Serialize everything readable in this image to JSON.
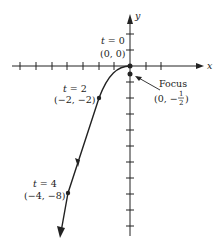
{
  "diagram": {
    "type": "parametric-curve",
    "axes": {
      "x_label": "x",
      "y_label": "y",
      "origin_px": [
        130,
        66
      ],
      "unit_px": 16
    },
    "labels": {
      "t0_param": "t = 0",
      "t0_point": "(0, 0)",
      "t2_param": "t = 2",
      "t2_point": "(−2, −2)",
      "t4_param": "t = 4",
      "t4_point": "(−4, −8)",
      "focus_label": "Focus",
      "focus_point_prefix": "(0, −",
      "focus_frac_num": "1",
      "focus_frac_den": "2",
      "focus_point_suffix": ")"
    },
    "points": [
      {
        "name": "t0",
        "t": 0,
        "x": 0,
        "y": 0
      },
      {
        "name": "t2",
        "t": 2,
        "x": -2,
        "y": -2
      },
      {
        "name": "t4",
        "t": 4,
        "x": -4,
        "y": -8
      },
      {
        "name": "focus",
        "x": 0,
        "y": -0.5
      }
    ],
    "colors": {
      "ink": "#222222",
      "background": "#ffffff"
    }
  }
}
